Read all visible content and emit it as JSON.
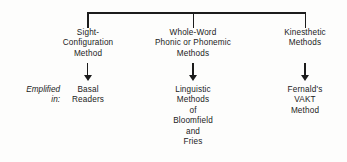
{
  "diagram": {
    "background_color": "#fdfdfc",
    "line_color": "#1c1c1c",
    "text_color": "#1b1b1b",
    "side_label": {
      "name": "exemplified-in-label",
      "lines": [
        "Emplified",
        "in:"
      ]
    },
    "columns": [
      {
        "id": "sight-configuration",
        "header": {
          "lines": [
            "Sight-",
            "Configuration",
            "Method"
          ]
        },
        "arrow": {
          "name": "arrow-down-sight-configuration"
        },
        "example": {
          "lines": [
            "Basal",
            "Readers"
          ]
        }
      },
      {
        "id": "whole-word-phonic",
        "header": {
          "lines": [
            "Whole-Word",
            "Phonic or Phonemic",
            "Methods"
          ]
        },
        "arrow": {
          "name": "arrow-down-whole-word-phonic"
        },
        "example": {
          "lines": [
            "Linguistic",
            "Methods",
            "of",
            "Bloomfield",
            "and",
            "Fries"
          ]
        }
      },
      {
        "id": "kinesthetic",
        "header": {
          "lines": [
            "Kinesthetic",
            "Methods"
          ]
        },
        "arrow": {
          "name": "arrow-down-kinesthetic"
        },
        "example": {
          "lines": [
            "Fernald's",
            "VAKT",
            "Method"
          ]
        }
      }
    ]
  }
}
